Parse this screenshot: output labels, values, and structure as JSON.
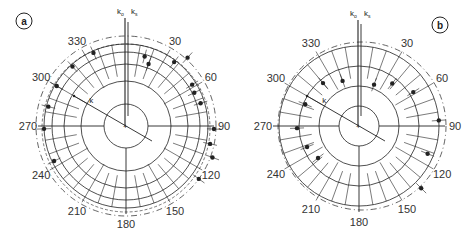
{
  "figure": {
    "panels": [
      {
        "id": "a",
        "label": "a",
        "center": [
          126,
          126
        ],
        "radii": [
          22,
          45,
          62,
          74,
          82
        ],
        "axis_labels": {
          "k0": "k",
          "k0_sub": "o",
          "ks": "k",
          "ks_sub": "s",
          "k": "k"
        },
        "angle_labels": [
          "30",
          "60",
          "90",
          "120",
          "150",
          "180",
          "210",
          "240",
          "270",
          "300",
          "330"
        ],
        "points": [
          {
            "angle": 336,
            "r": 80
          },
          {
            "angle": 318,
            "r": 80
          },
          {
            "angle": 300,
            "r": 80
          },
          {
            "angle": 284,
            "r": 80
          },
          {
            "angle": 268,
            "r": 82
          },
          {
            "angle": 244,
            "r": 80
          },
          {
            "angle": 15,
            "r": 72
          },
          {
            "angle": 20,
            "r": 66
          },
          {
            "angle": 37,
            "r": 80
          },
          {
            "angle": 42,
            "r": 92
          },
          {
            "angle": 58,
            "r": 78
          },
          {
            "angle": 64,
            "r": 76
          },
          {
            "angle": 73,
            "r": 78
          },
          {
            "angle": 92,
            "r": 88
          },
          {
            "angle": 102,
            "r": 86
          },
          {
            "angle": 110,
            "r": 92
          },
          {
            "angle": 126,
            "r": 90
          }
        ]
      },
      {
        "id": "b",
        "label": "b",
        "center": [
          359,
          126
        ],
        "radii": [
          20,
          40,
          60,
          80
        ],
        "axis_labels": {
          "k0": "k",
          "k0_sub": "o",
          "ks": "k",
          "ks_sub": "s",
          "k": "k"
        },
        "angle_labels": [
          "30",
          "60",
          "90",
          "120",
          "150",
          "180",
          "210",
          "240",
          "270",
          "300",
          "330"
        ],
        "points": [
          {
            "angle": 320,
            "r": 56
          },
          {
            "angle": 340,
            "r": 48
          },
          {
            "angle": 20,
            "r": 44
          },
          {
            "angle": 38,
            "r": 54
          },
          {
            "angle": 58,
            "r": 64
          },
          {
            "angle": 86,
            "r": 80
          },
          {
            "angle": 112,
            "r": 74
          },
          {
            "angle": 135,
            "r": 88
          },
          {
            "angle": 292,
            "r": 58
          },
          {
            "angle": 268,
            "r": 62
          },
          {
            "angle": 248,
            "r": 56
          },
          {
            "angle": 232,
            "r": 52
          }
        ]
      }
    ]
  },
  "caption_partial": "",
  "colors": {
    "ink": "#222222",
    "background": "#ffffff"
  }
}
